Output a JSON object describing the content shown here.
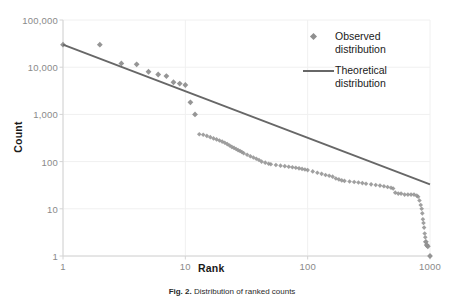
{
  "figure": {
    "caption_label": "Fig. 2.",
    "caption_text": "Distribution of ranked counts"
  },
  "axes": {
    "x_title": "Rank",
    "y_title": "Count",
    "x_ticks": [
      "1",
      "10",
      "100",
      "1000"
    ],
    "y_ticks": [
      "100,000",
      "10,000",
      "1,000",
      "100",
      "10",
      "1"
    ]
  },
  "legend": {
    "items": [
      {
        "label": "Observed\ndistribution",
        "marker": "diamond",
        "color": "#8f8f8f"
      },
      {
        "label": "Theoretical\ndistribution",
        "marker": "line",
        "color": "#676767"
      }
    ]
  },
  "colors": {
    "observed": "#8f8f8f",
    "theoretical": "#676767",
    "axis": "#d4d4d4",
    "gridline": "#f0f0f0",
    "tick_text": "#8a8a8a",
    "title_text": "#1a1a1a",
    "background": "#ffffff"
  },
  "chart_data": {
    "type": "scatter",
    "title": "",
    "xlabel": "Rank",
    "ylabel": "Count",
    "xscale": "log",
    "yscale": "log",
    "xlim": [
      1,
      1000
    ],
    "ylim": [
      1,
      100000
    ],
    "grid": true,
    "legend_position": "top-right",
    "series": [
      {
        "name": "Observed distribution",
        "type": "scatter",
        "marker": "diamond",
        "color": "#8f8f8f",
        "points": [
          [
            1,
            30000
          ],
          [
            2,
            30000
          ],
          [
            3,
            12000
          ],
          [
            4,
            11500
          ],
          [
            5,
            8000
          ],
          [
            6,
            7000
          ],
          [
            7,
            6500
          ],
          [
            8,
            4800
          ],
          [
            9,
            4500
          ],
          [
            10,
            4200
          ],
          [
            11,
            1800
          ],
          [
            12,
            1000
          ],
          [
            13,
            380
          ],
          [
            14,
            370
          ],
          [
            15,
            350
          ],
          [
            16,
            330
          ],
          [
            17,
            310
          ],
          [
            18,
            295
          ],
          [
            19,
            280
          ],
          [
            20,
            265
          ],
          [
            21,
            250
          ],
          [
            22,
            235
          ],
          [
            23,
            220
          ],
          [
            24,
            205
          ],
          [
            25,
            195
          ],
          [
            26,
            185
          ],
          [
            27,
            175
          ],
          [
            28,
            168
          ],
          [
            29,
            160
          ],
          [
            30,
            150
          ],
          [
            32,
            140
          ],
          [
            34,
            130
          ],
          [
            36,
            122
          ],
          [
            38,
            115
          ],
          [
            40,
            108
          ],
          [
            42,
            100
          ],
          [
            45,
            95
          ],
          [
            48,
            90
          ],
          [
            50,
            88
          ],
          [
            55,
            85
          ],
          [
            60,
            82
          ],
          [
            65,
            80
          ],
          [
            70,
            78
          ],
          [
            75,
            76
          ],
          [
            80,
            74
          ],
          [
            85,
            72
          ],
          [
            90,
            70
          ],
          [
            95,
            68
          ],
          [
            100,
            66
          ],
          [
            110,
            62
          ],
          [
            120,
            58
          ],
          [
            130,
            55
          ],
          [
            140,
            52
          ],
          [
            150,
            50
          ],
          [
            160,
            48
          ],
          [
            170,
            44
          ],
          [
            180,
            42
          ],
          [
            190,
            40
          ],
          [
            200,
            39
          ],
          [
            220,
            38
          ],
          [
            240,
            37
          ],
          [
            260,
            36
          ],
          [
            280,
            35
          ],
          [
            300,
            34
          ],
          [
            330,
            33
          ],
          [
            360,
            32
          ],
          [
            390,
            31
          ],
          [
            420,
            30
          ],
          [
            450,
            29
          ],
          [
            480,
            28
          ],
          [
            500,
            27
          ],
          [
            520,
            22
          ],
          [
            550,
            21
          ],
          [
            580,
            21
          ],
          [
            620,
            20
          ],
          [
            660,
            20
          ],
          [
            700,
            20
          ],
          [
            740,
            20
          ],
          [
            780,
            19
          ],
          [
            800,
            18
          ],
          [
            820,
            15
          ],
          [
            840,
            12
          ],
          [
            855,
            10
          ],
          [
            865,
            8
          ],
          [
            875,
            6
          ],
          [
            885,
            5
          ],
          [
            895,
            4
          ],
          [
            905,
            3
          ],
          [
            915,
            2.5
          ],
          [
            925,
            2
          ],
          [
            940,
            1.7
          ],
          [
            960,
            1.6
          ],
          [
            1000,
            1
          ]
        ]
      },
      {
        "name": "Theoretical distribution",
        "type": "line",
        "color": "#676767",
        "points": [
          [
            1,
            30000
          ],
          [
            1000,
            33
          ]
        ],
        "description": "Power-law reference line from (1, 30000) to (1000, 33)"
      }
    ]
  }
}
